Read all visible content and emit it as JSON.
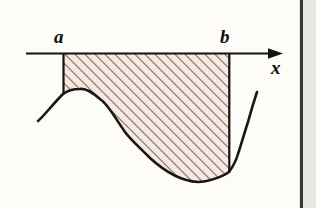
{
  "figure": {
    "labels": {
      "a": "a",
      "b": "b",
      "x_axis": "x"
    },
    "icon_names": {
      "axis_arrow": "arrow-right-icon",
      "hatch_fill": "diagonal-hatch-icon"
    },
    "colors": {
      "page_background": "#fdfcf9",
      "ink": "#100d0b",
      "curve": "#1a1613",
      "region_fill": "#f6e9e1",
      "hatch_line": "#7a6a60",
      "axis": "#171311",
      "gutter": "#e9e7e3",
      "gutter_rule": "#3b3835"
    },
    "geometry": {
      "axis": {
        "y": 53,
        "x_start": 26,
        "x_end": 283,
        "arrow_tip_x": 283,
        "arrow_head_length": 13,
        "arrow_head_half_width": 5,
        "stroke_width": 2
      },
      "a": {
        "x": 63,
        "y_top": 53,
        "y_curve": 94
      },
      "b": {
        "x": 229,
        "y_top": 53,
        "y_curve": 172
      },
      "hatch": {
        "angle_deg": 45,
        "spacing": 5,
        "stroke_width": 1.1
      },
      "curve_points": [
        {
          "x": 38,
          "y": 121
        },
        {
          "x": 50,
          "y": 110
        },
        {
          "x": 63,
          "y": 94
        },
        {
          "x": 80,
          "y": 89
        },
        {
          "x": 100,
          "y": 99
        },
        {
          "x": 125,
          "y": 132
        },
        {
          "x": 150,
          "y": 158
        },
        {
          "x": 175,
          "y": 175
        },
        {
          "x": 198,
          "y": 182
        },
        {
          "x": 215,
          "y": 179
        },
        {
          "x": 229,
          "y": 172
        },
        {
          "x": 238,
          "y": 154
        },
        {
          "x": 248,
          "y": 122
        },
        {
          "x": 257,
          "y": 92
        }
      ]
    }
  }
}
